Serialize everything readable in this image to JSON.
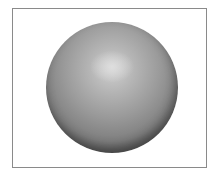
{
  "image": {
    "description": "Shaded grey 3D sphere inside a thin rectangular frame",
    "colors": {
      "frame_border": "#8a8a8a",
      "background": "#ffffff",
      "sphere_highlight": "#d8d8d8",
      "sphere_mid": "#9a9a9a",
      "sphere_shadow": "#3a3a3a"
    }
  }
}
